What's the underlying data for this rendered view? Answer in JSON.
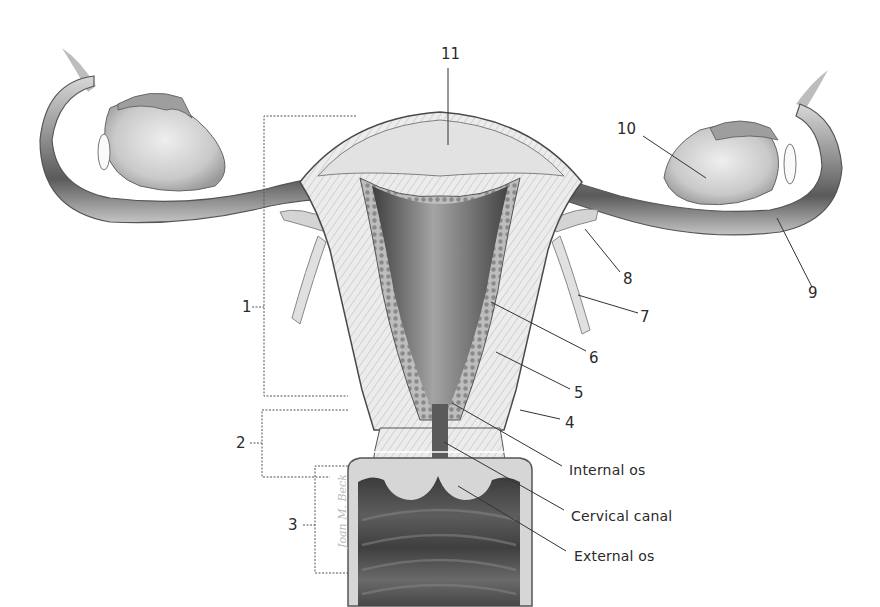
{
  "figure": {
    "signature": "Joan M. Beck",
    "number_labels": [
      {
        "id": "1",
        "text": "1"
      },
      {
        "id": "2",
        "text": "2"
      },
      {
        "id": "3",
        "text": "3"
      },
      {
        "id": "4",
        "text": "4"
      },
      {
        "id": "5",
        "text": "5"
      },
      {
        "id": "6",
        "text": "6"
      },
      {
        "id": "7",
        "text": "7"
      },
      {
        "id": "8",
        "text": "8"
      },
      {
        "id": "9",
        "text": "9"
      },
      {
        "id": "10",
        "text": "10"
      },
      {
        "id": "11",
        "text": "11"
      }
    ],
    "text_labels": [
      {
        "id": "internal-os",
        "text": "Internal os"
      },
      {
        "id": "cervical-canal",
        "text": "Cervical canal"
      },
      {
        "id": "external-os",
        "text": "External os"
      }
    ],
    "colors": {
      "ink": "#2a2a2a",
      "tissue_light": "#e4e4e4",
      "tissue_mid": "#a8a8a8",
      "tissue_dark": "#4a4a4a"
    }
  }
}
